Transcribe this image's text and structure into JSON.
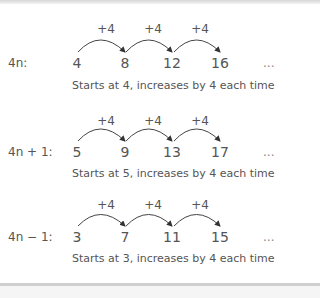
{
  "sequences": [
    {
      "label": "4n:",
      "terms": [
        "4",
        "8",
        "12",
        "16"
      ],
      "steps": [
        "+4",
        "+4",
        "+4"
      ],
      "ellipsis": "...",
      "description": "Starts at 4, increases by 4 each time"
    },
    {
      "label": "4n + 1:",
      "terms": [
        "5",
        "9",
        "13",
        "17"
      ],
      "steps": [
        "+4",
        "+4",
        "+4"
      ],
      "ellipsis": "...",
      "description": "Starts at 5, increases by 4 each time"
    },
    {
      "label": "4n − 1:",
      "terms": [
        "3",
        "7",
        "11",
        "15"
      ],
      "steps": [
        "+4",
        "+4",
        "+4"
      ],
      "ellipsis": "...",
      "description": "Starts at 3, increases by 4 each time"
    }
  ]
}
